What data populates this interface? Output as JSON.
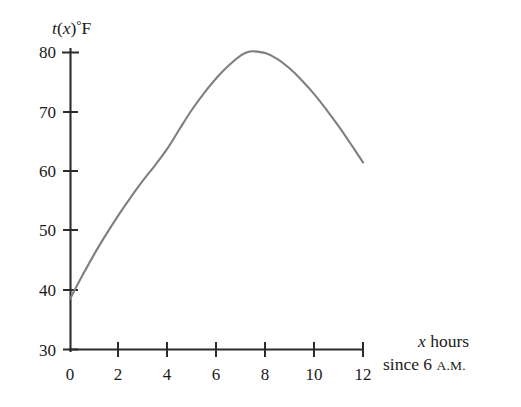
{
  "figure": {
    "background_color": "#ffffff",
    "axis_color": "#2b2b2b",
    "curve_color": "#7f7f7f"
  },
  "yaxis": {
    "title_fn": "t",
    "title_paren_open": "(",
    "title_var": "x",
    "title_paren_close": ")",
    "title_degree": "°",
    "title_unit": "F",
    "ticks": [
      "80",
      "70",
      "60",
      "50",
      "40",
      "30"
    ]
  },
  "xaxis": {
    "ticks": [
      "0",
      "2",
      "4",
      "6",
      "8",
      "10",
      "12"
    ],
    "caption_var": "x",
    "caption_line1_rest": " hours",
    "caption_line2_pre": "since 6 ",
    "caption_line2_smallcaps": "A.M."
  },
  "chart_data": {
    "type": "line",
    "title": "",
    "xlabel": "x hours since 6 A.M.",
    "ylabel": "t(x)°F",
    "xlim": [
      0,
      12
    ],
    "ylim": [
      30,
      80
    ],
    "xticks": [
      0,
      2,
      4,
      6,
      8,
      10,
      12
    ],
    "yticks": [
      30,
      40,
      50,
      60,
      70,
      80
    ],
    "grid": false,
    "legend": "none",
    "series": [
      {
        "name": "t(x)",
        "color": "#7f7f7f",
        "x": [
          0,
          0.5,
          1,
          1.5,
          2,
          2.5,
          3,
          3.5,
          4,
          4.5,
          5,
          5.5,
          6,
          6.5,
          7,
          7.3,
          7.5,
          8,
          8.5,
          9,
          9.5,
          10,
          10.5,
          11,
          11.5,
          12
        ],
        "y": [
          38.5,
          42.4,
          46.1,
          49.5,
          52.7,
          55.7,
          58.5,
          61.1,
          63.9,
          67.2,
          70.4,
          73.2,
          75.7,
          77.8,
          79.5,
          80.1,
          80.2,
          79.9,
          78.9,
          77.3,
          75.3,
          73.0,
          70.4,
          67.6,
          64.6,
          61.5
        ]
      }
    ],
    "annotations": [
      {
        "text": "peak",
        "x": 7.4,
        "y": 80.2
      },
      {
        "text": "start",
        "x": 0,
        "y": 38.5
      },
      {
        "text": "end",
        "x": 12,
        "y": 61.5
      }
    ]
  }
}
